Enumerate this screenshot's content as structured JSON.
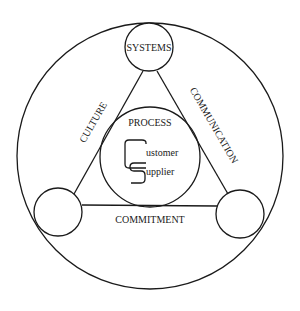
{
  "diagram": {
    "type": "concept-diagram",
    "outer_circle": {
      "cx": 150,
      "cy": 156,
      "r": 133
    },
    "nodes": [
      {
        "id": "systems",
        "label": "SYSTEMS",
        "cx": 149,
        "cy": 47,
        "r": 24
      },
      {
        "id": "left",
        "label": "",
        "cx": 58,
        "cy": 212,
        "r": 24
      },
      {
        "id": "right",
        "label": "",
        "cx": 240,
        "cy": 214,
        "r": 24
      }
    ],
    "center": {
      "title": "PROCESS",
      "cx": 150,
      "cy": 157,
      "r": 50,
      "logo_letters": [
        "C",
        "S"
      ],
      "line1": "ustomer",
      "line2": "upplier"
    },
    "edges": [
      {
        "label": "CULTURE",
        "from": "systems",
        "to": "left"
      },
      {
        "label": "COMMUNICATION",
        "from": "systems",
        "to": "right"
      },
      {
        "label": "COMMITMENT",
        "from": "left",
        "to": "right"
      }
    ],
    "colors": {
      "stroke": "#1a1a1a",
      "background": "#ffffff"
    }
  }
}
